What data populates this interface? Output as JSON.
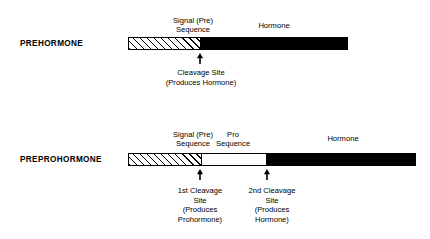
{
  "diagram": {
    "colors": {
      "ink": "#000000",
      "background": "#ffffff",
      "hormone_fill": "#000000",
      "pro_fill": "#ffffff",
      "signal_fill": "hatched"
    },
    "rows": [
      {
        "id": "prehormone",
        "label": "PREHORMONE",
        "segments": [
          {
            "name": "signal-sequence",
            "style": "hatched",
            "caption": "Signal (Pre)\nSequence"
          },
          {
            "name": "hormone",
            "style": "solid-black",
            "caption": "Hormone"
          }
        ],
        "markers": [
          {
            "name": "cleavage-site",
            "icon": "up-arrow-icon",
            "caption": "Cleavage Site\n(Produces Hormone)"
          }
        ]
      },
      {
        "id": "preprohormone",
        "label": "PREPROHORMONE",
        "segments": [
          {
            "name": "signal-sequence",
            "style": "hatched",
            "caption": "Signal (Pre)\nSequence"
          },
          {
            "name": "pro-sequence",
            "style": "white-outline",
            "caption": "Pro\nSequence"
          },
          {
            "name": "hormone",
            "style": "solid-black",
            "caption": "Hormone"
          }
        ],
        "markers": [
          {
            "name": "first-cleavage-site",
            "icon": "up-arrow-icon",
            "caption": "1st Cleavage\nSite\n(Produces\nProhormone)"
          },
          {
            "name": "second-cleavage-site",
            "icon": "up-arrow-icon",
            "caption": "2nd Cleavage\nSite\n(Produces\nHormone)"
          }
        ]
      }
    ]
  }
}
